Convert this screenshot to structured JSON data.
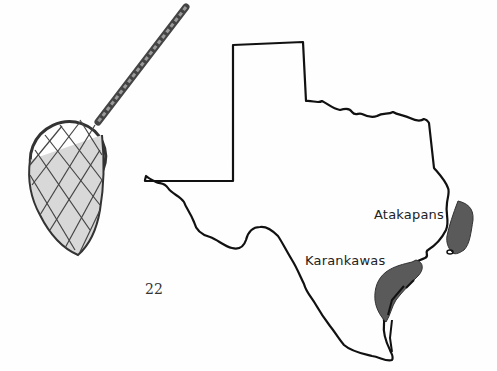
{
  "page": {
    "page_number": "22"
  },
  "illustration": {
    "subject": "dip-net-icon"
  },
  "map": {
    "region": "Texas",
    "labels": [
      {
        "name": "Atakapans",
        "x": 374,
        "y": 207
      },
      {
        "name": "Karankawas",
        "x": 305,
        "y": 253
      }
    ],
    "shaded_areas": [
      {
        "tribe": "Atakapans",
        "color": "#5a5a5a"
      },
      {
        "tribe": "Karankawas",
        "color": "#5a5a5a"
      }
    ],
    "outline_color": "#111111"
  }
}
